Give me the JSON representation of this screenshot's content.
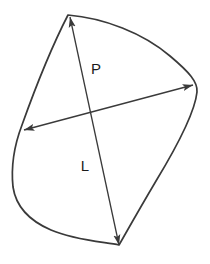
{
  "figure": {
    "background_color": "#ffffff",
    "outline": {
      "name": "shape-outline",
      "stroke_color": "#3a3a3a",
      "stroke_width": 1.7,
      "fill": "none",
      "vertices": {
        "top": [
          68,
          15
        ],
        "bottom": [
          119,
          245
        ],
        "leftmost": [
          13,
          185
        ],
        "rightmost": [
          197,
          90
        ]
      },
      "path": "M 68 15 C 104 18 143 33 170 56 C 189 72 198 82 197 92 C 195 112 176 148 156 181 C 140 208 127 231 119 245 C 104 242 74 240 51 230 C 30 221 16 207 13 187 C 11 168 14 146 22 125 C 32 97 50 50 68 15 Z"
    },
    "dimensions": [
      {
        "name": "dimension-p",
        "label": "P",
        "label_position": [
          96,
          70
        ],
        "label_font_size": 15,
        "start": [
          24,
          130
        ],
        "end": [
          193,
          85
        ],
        "arrow_start": true,
        "arrow_end": true,
        "stroke_color": "#3a3a3a",
        "stroke_width": 1.3
      },
      {
        "name": "dimension-l",
        "label": "L",
        "label_position": [
          85,
          167
        ],
        "label_font_size": 15,
        "start": [
          119,
          245
        ],
        "end": [
          70,
          17
        ],
        "arrow_start": true,
        "arrow_end": true,
        "stroke_color": "#3a3a3a",
        "stroke_width": 1.3
      }
    ],
    "text_color": "#1a1a1a"
  }
}
